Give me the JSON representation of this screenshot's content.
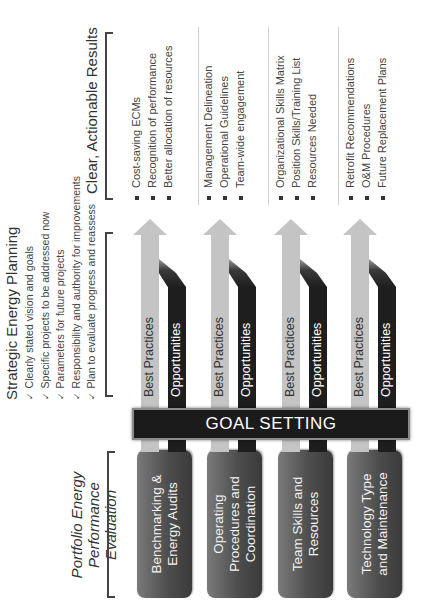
{
  "left_section": {
    "title_line1": "Portfolio Energy",
    "title_line2": "Performance Evaluation",
    "boxes": [
      {
        "line1": "Benchmarking &",
        "line2": "Energy Audits"
      },
      {
        "line1": "Operating",
        "line2": "Procedures and",
        "line3": "Coordination"
      },
      {
        "line1": "Team Skills and",
        "line2": "Resources"
      },
      {
        "line1": "Technology Type",
        "line2": "and Maintenance"
      }
    ]
  },
  "goal_setting": {
    "label": "GOAL SETTING"
  },
  "arrows": {
    "best_practices_label": "Best Practices",
    "opportunities_label": "Opportunities"
  },
  "strategic_planning": {
    "title": "Strategic Energy Planning",
    "check_glyph": "✓",
    "items": [
      "Clearly stated vision and goals",
      "Specific projects to be addressed now",
      "Parameters for future projects",
      "Responsibility and authority for improvements",
      "Plan to evaluate progress and reassess"
    ]
  },
  "results": {
    "title": "Clear, Actionable Results",
    "groups": [
      [
        "Cost-saving ECMs",
        "Recognition of performance",
        "Better allocation of resources"
      ],
      [
        "Management Delineation",
        "Operational Guidelines",
        "Team-wide engagement"
      ],
      [
        "Organizational Skills Matrix",
        "Position Skills/Training List",
        "Resources Needed"
      ],
      [
        "Retrofit Recommendations",
        "O&M Procedures",
        "Future Replacement Plans"
      ]
    ]
  },
  "colors": {
    "box_gray": "#4e4e4e",
    "goal_bar": "#1b1b1b",
    "best_practices_arrow": "#c4c4c4",
    "opportunities_arrow": "#1e1e1e",
    "text": "#333333"
  }
}
